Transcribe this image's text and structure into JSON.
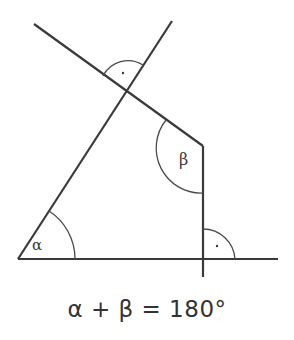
{
  "diagram": {
    "labels": {
      "alpha": "α",
      "beta": "β",
      "right_angle_marker": "·"
    },
    "formula": "α + β = 180°",
    "colors": {
      "line": "#3a3a3a",
      "background": "#ffffff"
    }
  }
}
